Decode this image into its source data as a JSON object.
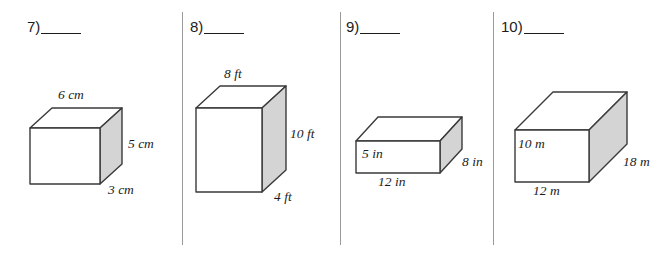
{
  "worksheet": {
    "background_color": "#ffffff",
    "divider_color": "#9a9a9a",
    "outline_color": "#3a3a3a",
    "side_face_color": "#d4d4d4",
    "top_face_color": "#ffffff",
    "front_face_color": "#ffffff"
  },
  "problems": [
    {
      "number": "7)",
      "blank": "",
      "unit": "cm",
      "labels": {
        "top": "6 cm",
        "right": "5 cm",
        "depth": "3 cm"
      },
      "dimensions": {
        "width": "6",
        "height": "5",
        "depth": "3"
      }
    },
    {
      "number": "8)",
      "blank": "",
      "unit": "ft",
      "labels": {
        "top": "8 ft",
        "right": "10 ft",
        "depth": "4 ft"
      },
      "dimensions": {
        "width": "8",
        "height": "10",
        "depth": "4"
      }
    },
    {
      "number": "9)",
      "blank": "",
      "unit": "in",
      "labels": {
        "left": "5 in",
        "bottom": "12 in",
        "depth": "8 in"
      },
      "dimensions": {
        "width": "12",
        "height": "5",
        "depth": "8"
      }
    },
    {
      "number": "10)",
      "blank": "",
      "unit": "m",
      "labels": {
        "left": "10 m",
        "bottom": "12 m",
        "depth": "18 m"
      },
      "dimensions": {
        "width": "12",
        "height": "10",
        "depth": "18"
      }
    }
  ]
}
